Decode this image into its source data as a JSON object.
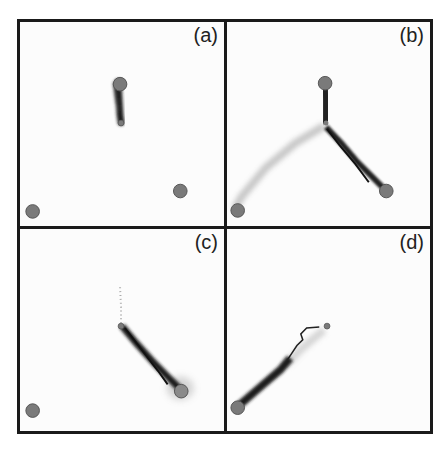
{
  "figure": {
    "panels": [
      {
        "id": "a",
        "label": "(a)"
      },
      {
        "id": "b",
        "label": "(b)"
      },
      {
        "id": "c",
        "label": "(c)"
      },
      {
        "id": "d",
        "label": "(d)"
      }
    ],
    "colors": {
      "node": "#7a7a7a",
      "trail": "#1e1e1e",
      "border": "#1a1a1a",
      "background": "#fcfcfc"
    }
  }
}
